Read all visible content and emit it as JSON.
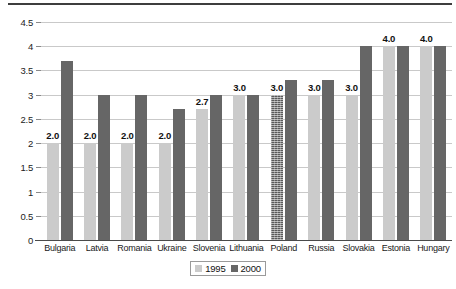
{
  "chart_data": {
    "type": "bar",
    "title": "",
    "xlabel": "",
    "ylabel": "",
    "ylim": [
      0,
      4.5
    ],
    "grid": true,
    "legend_position": "bottom-center",
    "categories": [
      "Bulgaria",
      "Latvia",
      "Romania",
      "Ukraine",
      "Slovenia",
      "Lithuania",
      "Poland",
      "Russia",
      "Slovakia",
      "Estonia",
      "Hungary"
    ],
    "yticks": [
      "0",
      "0.5",
      "1",
      "1.5",
      "2",
      "2.5",
      "3",
      "3.5",
      "4",
      "4.5"
    ],
    "ytick_values": [
      0,
      0.5,
      1,
      1.5,
      2,
      2.5,
      3,
      3.5,
      4,
      4.5
    ],
    "series": [
      {
        "name": "1995",
        "color": "#cbcbcb",
        "values": [
          2.0,
          2.0,
          2.0,
          2.0,
          2.7,
          3.0,
          3.0,
          3.0,
          3.0,
          4.0,
          4.0
        ],
        "labels": [
          "2.0",
          "2.0",
          "2.0",
          "2.0",
          "2.7",
          "3.0",
          "3.0",
          "3.0",
          "3.0",
          "4.0",
          "4.0"
        ]
      },
      {
        "name": "2000",
        "color": "#666666",
        "values": [
          3.7,
          3.0,
          3.0,
          2.7,
          3.0,
          3.0,
          3.3,
          3.3,
          4.0,
          4.0,
          4.0
        ],
        "labels": [
          "",
          "",
          "",
          "",
          "",
          "",
          "",
          "",
          "",
          "",
          ""
        ]
      }
    ]
  },
  "legend": {
    "items": [
      {
        "label": "1995"
      },
      {
        "label": "2000"
      }
    ]
  }
}
